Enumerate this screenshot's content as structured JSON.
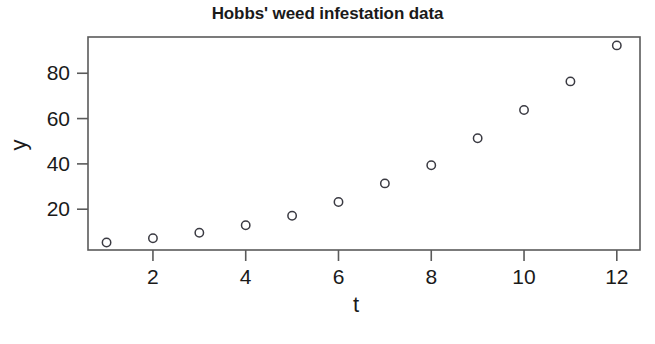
{
  "chart_data": {
    "type": "scatter",
    "title": "Hobbs' weed infestation data",
    "xlabel": "t",
    "ylabel": "y",
    "x": [
      1,
      2,
      3,
      4,
      5,
      6,
      7,
      8,
      9,
      10,
      11,
      12
    ],
    "values": [
      5.3,
      7.2,
      9.6,
      12.9,
      17.1,
      23.2,
      31.4,
      39.4,
      51.3,
      63.8,
      76.4,
      92.3
    ],
    "xticks": [
      2,
      4,
      6,
      8,
      10,
      12
    ],
    "xtick_labels": [
      "2",
      "4",
      "6",
      "8",
      "10",
      "12"
    ],
    "yticks": [
      20,
      40,
      60,
      80
    ],
    "ytick_labels": [
      "20",
      "40",
      "60",
      "80"
    ],
    "xlim": [
      0.6,
      12.5
    ],
    "ylim": [
      2.0,
      96.0
    ],
    "grid": false,
    "legend": null,
    "marker": "open-circle",
    "marker_color": "#3a3a42",
    "frame_color": "#5a5a5a",
    "background_color": "#ffffff"
  },
  "labels": {
    "title": "Hobbs' weed infestation data",
    "x_axis_title": "t",
    "y_axis_title": "y"
  }
}
